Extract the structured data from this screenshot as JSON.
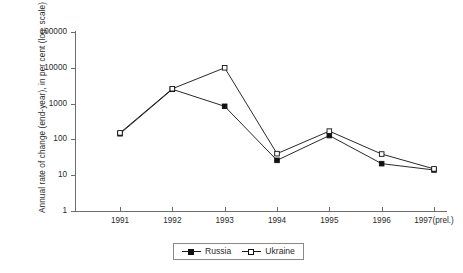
{
  "chart_data": {
    "type": "line",
    "title": "",
    "xlabel": "",
    "ylabel": "Annual rate of change (end-year), in per cent (log. scale)",
    "x": [
      "1991",
      "1992",
      "1993",
      "1994",
      "1995",
      "1996",
      "1997(prel.)"
    ],
    "categories": [
      "1991",
      "1992",
      "1993",
      "1994",
      "1995",
      "1996",
      "1997(prel.)"
    ],
    "yticks": [
      "1",
      "10",
      "100",
      "1000",
      "10000",
      "100000"
    ],
    "ytick_values": [
      1,
      10,
      100,
      1000,
      10000,
      100000
    ],
    "ylim": [
      1,
      100000
    ],
    "yscale": "log",
    "grid": false,
    "legend_position": "bottom-center",
    "series": [
      {
        "name": "Russia",
        "marker": "filled-square",
        "color": "#111111",
        "values": [
          144,
          2510,
          840,
          26,
          128,
          21,
          14
        ]
      },
      {
        "name": "Ukraine",
        "marker": "hollow-square",
        "color": "#111111",
        "values": [
          152,
          2600,
          10000,
          40,
          170,
          39,
          15
        ]
      }
    ]
  },
  "axes": {
    "y_title": "Annual rate of change (end-year), in per cent (log. scale)",
    "y_tick_labels": [
      "100000",
      "10000",
      "1000",
      "100",
      "10",
      "1"
    ],
    "x_tick_labels": [
      "1991",
      "1992",
      "1993",
      "1994",
      "1995",
      "1996",
      "1997(prel.)"
    ]
  },
  "legend": {
    "items": [
      {
        "label": "Russia",
        "marker": "filled-square"
      },
      {
        "label": "Ukraine",
        "marker": "hollow-square"
      }
    ]
  },
  "colors": {
    "axis": "#6d6d6d",
    "series": "#111111",
    "text": "#2b2b2b",
    "background": "#ffffff",
    "legend_border": "#8a8a8a"
  }
}
